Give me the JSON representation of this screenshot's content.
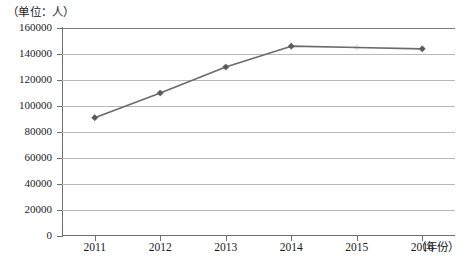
{
  "chart_data": {
    "type": "line",
    "title": "",
    "unit_label": "（单位：人）",
    "xlabel": "（年份）",
    "ylabel": "",
    "categories": [
      "2011",
      "2012",
      "2013",
      "2014",
      "2015",
      "2016"
    ],
    "series": [
      {
        "name": "",
        "values": [
          91000,
          110000,
          130000,
          146000,
          145000,
          144000
        ]
      }
    ],
    "ylim": [
      0,
      160000
    ],
    "y_ticks": [
      "0",
      "20000",
      "40000",
      "60000",
      "80000",
      "100000",
      "120000",
      "140000",
      "160000"
    ],
    "y_tick_values": [
      0,
      20000,
      40000,
      60000,
      80000,
      100000,
      120000,
      140000,
      160000
    ],
    "grid": true,
    "legend": "none",
    "line_color": "#6b6b6b",
    "marker_color": "#5a5a5a",
    "gridline_color": "#b8b8b8",
    "axis_color": "#6e6e6e"
  },
  "caption": ""
}
